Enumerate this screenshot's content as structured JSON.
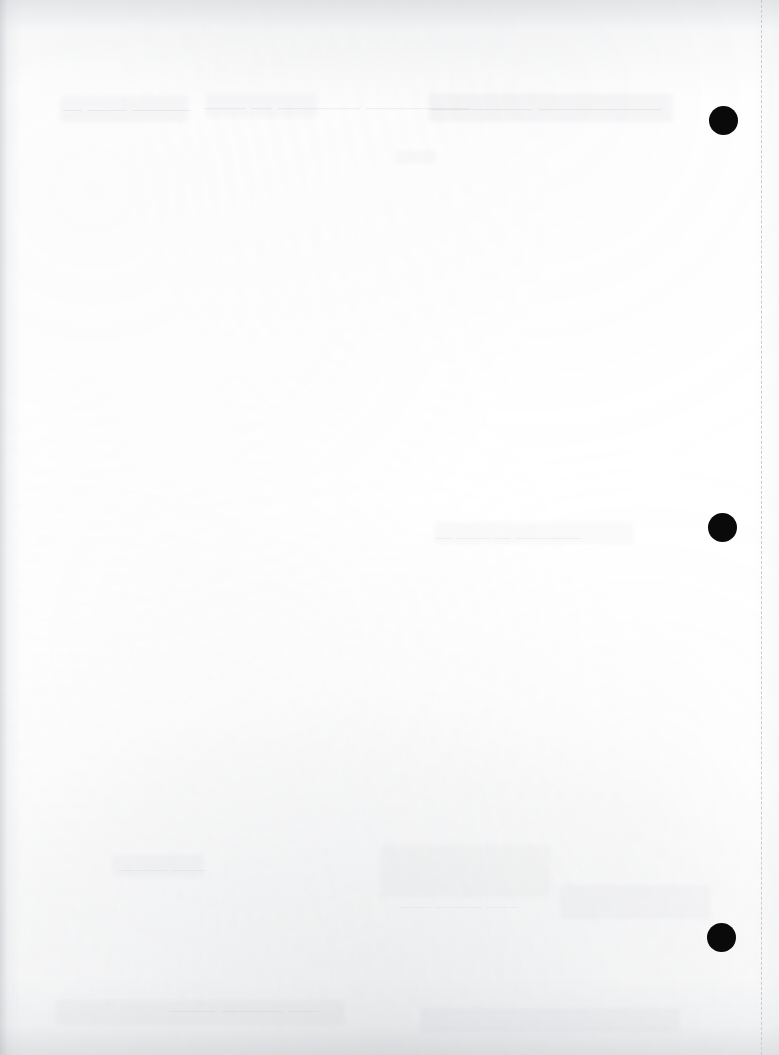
{
  "page": {
    "width": 779,
    "height": 1055,
    "background_color": "#ffffff",
    "content_summary": "Blank scanned document page with three black punch-hole marks along the right side, a dashed right margin guide, and faint illegible bleed-through ghost text"
  },
  "margin_guide": {
    "name": "right-margin-dashed-line",
    "x": 761,
    "color": "#c8ccd2",
    "thickness_px": 1,
    "dash_length_px": 7,
    "dash_gap_px": 6,
    "style": "dashed"
  },
  "punch_dots": [
    {
      "label": "punch-hole-top",
      "cx": 723,
      "cy": 120,
      "diameter": 29,
      "color": "#0a0a0a"
    },
    {
      "label": "punch-hole-middle",
      "cx": 722,
      "cy": 527,
      "diameter": 29,
      "color": "#0a0a0a"
    },
    {
      "label": "punch-hole-bottom",
      "cx": 721,
      "cy": 937,
      "diameter": 29,
      "color": "#0a0a0a"
    }
  ],
  "ghost_text": [
    {
      "label": "ghost-line-top-left",
      "text": "— —— ———",
      "x": 63,
      "y": 98,
      "size": 19,
      "opacity": 0.09
    },
    {
      "label": "ghost-line-top-center",
      "text": "——  — ———— —————",
      "x": 205,
      "y": 96,
      "size": 20,
      "opacity": 0.1
    },
    {
      "label": "ghost-line-top-right",
      "text": "————— ——————",
      "x": 430,
      "y": 97,
      "size": 20,
      "opacity": 0.11
    },
    {
      "label": "ghost-line-mid-right",
      "text": "— —— —  ————",
      "x": 435,
      "y": 528,
      "size": 16,
      "opacity": 0.08
    },
    {
      "label": "ghost-line-lower-left",
      "text": "——— ——",
      "x": 118,
      "y": 860,
      "size": 16,
      "opacity": 0.07
    },
    {
      "label": "ghost-line-lower-mid",
      "text": "—— ——— ——",
      "x": 400,
      "y": 898,
      "size": 15,
      "opacity": 0.07
    },
    {
      "label": "ghost-line-bottom",
      "text": "——— ———— ——",
      "x": 170,
      "y": 1002,
      "size": 15,
      "opacity": 0.08
    }
  ],
  "ghost_smudges": [
    {
      "label": "smudge-top-left",
      "x": 60,
      "y": 96,
      "w": 128,
      "h": 26,
      "opacity": 0.05
    },
    {
      "label": "smudge-top-center",
      "x": 206,
      "y": 94,
      "w": 112,
      "h": 24,
      "opacity": 0.042
    },
    {
      "label": "smudge-top-right",
      "x": 428,
      "y": 94,
      "w": 245,
      "h": 28,
      "opacity": 0.058
    },
    {
      "label": "smudge-top-spot",
      "x": 395,
      "y": 150,
      "w": 42,
      "h": 14,
      "opacity": 0.038
    },
    {
      "label": "smudge-mid-right",
      "x": 434,
      "y": 522,
      "w": 200,
      "h": 22,
      "opacity": 0.04
    },
    {
      "label": "smudge-low-left",
      "x": 112,
      "y": 855,
      "w": 92,
      "h": 22,
      "opacity": 0.036
    },
    {
      "label": "smudge-low-mid",
      "x": 380,
      "y": 845,
      "w": 170,
      "h": 52,
      "opacity": 0.032
    },
    {
      "label": "smudge-low-right",
      "x": 560,
      "y": 885,
      "w": 150,
      "h": 34,
      "opacity": 0.036
    },
    {
      "label": "smudge-bottom-band",
      "x": 55,
      "y": 1000,
      "w": 290,
      "h": 26,
      "opacity": 0.04
    },
    {
      "label": "smudge-bottom-right",
      "x": 420,
      "y": 1008,
      "w": 260,
      "h": 24,
      "opacity": 0.034
    }
  ]
}
